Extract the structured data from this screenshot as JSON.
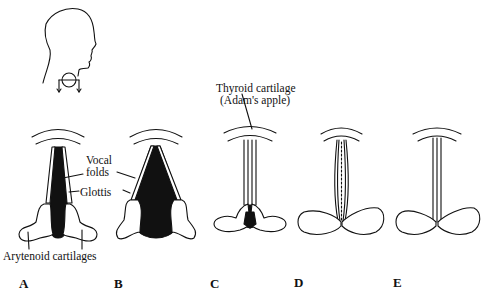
{
  "diagram": {
    "type": "anatomical-illustration",
    "inset": {
      "icon": "head-profile-with-larynx-view-icon"
    },
    "labels": {
      "thyroid_line1": "Thyroid cartilage",
      "thyroid_line2": "(Adam's apple)",
      "vocal_line1": "Vocal",
      "vocal_line2": "folds",
      "glottis": "Glottis",
      "arytenoid": "Arytenoid cartilages"
    },
    "panels": [
      {
        "letter": "A",
        "state": "glottis open (breathing)"
      },
      {
        "letter": "B",
        "state": "glottis wide open"
      },
      {
        "letter": "C",
        "state": "glottis partly closed at back"
      },
      {
        "letter": "D",
        "state": "vocal folds vibrating (voicing)"
      },
      {
        "letter": "E",
        "state": "glottis closed"
      }
    ],
    "colors": {
      "ink": "#111111",
      "background": "#ffffff"
    }
  }
}
